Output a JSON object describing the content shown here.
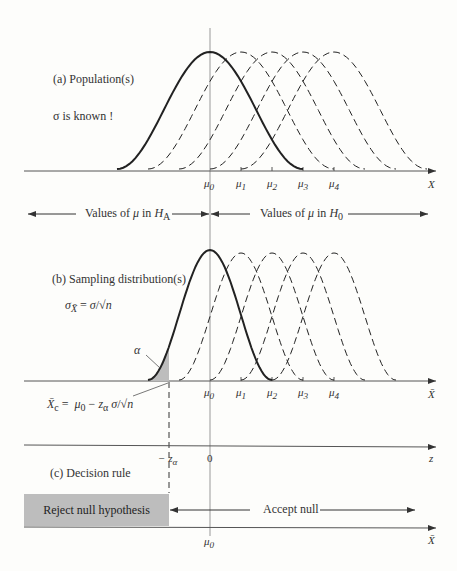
{
  "panel_a": {
    "title": "(a) Population(s)",
    "note": "σ is known !",
    "axis_label": "X",
    "ticks": [
      "μ0",
      "μ1",
      "μ2",
      "μ3",
      "μ4"
    ]
  },
  "hypotheses": {
    "left": "Values of μ in H_A",
    "right": "Values of μ in H_0"
  },
  "panel_b": {
    "title": "(b) Sampling distribution(s)",
    "formula": "σX̄ = σ/√n",
    "alpha_label": "α",
    "critical_formula": "X̄c = μ0 − zα σ/√n",
    "axis_label": "X̄",
    "ticks": [
      "μ0",
      "μ1",
      "μ2",
      "μ3",
      "μ4"
    ]
  },
  "z_axis": {
    "label": "z",
    "ticks": [
      "−zα",
      "0"
    ]
  },
  "panel_c": {
    "title": "(c) Decision rule",
    "reject": "Reject null hypothesis",
    "accept": "Accept null",
    "axis_label": "X̄",
    "tick": "μ0"
  },
  "colors": {
    "ink": "#333333",
    "shade": "#bdbdbd",
    "bg": "#fdfdfb"
  }
}
